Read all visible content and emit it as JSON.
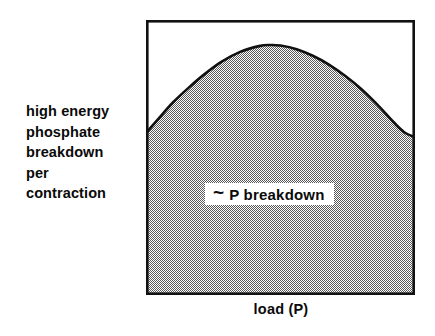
{
  "figure": {
    "name": "high-energy-phosphate-breakdown-vs-load",
    "y_axis_label_lines": [
      "high energy",
      "phosphate",
      "breakdown",
      "per",
      "contraction"
    ],
    "x_axis_label": "load  (P)",
    "annotation": {
      "symbol": "~",
      "text": "P breakdown"
    },
    "colors": {
      "frame": "#111111",
      "curve": "#111111",
      "fill_dither_dark": "#4a4a4a",
      "fill_background": "#ffffff",
      "text": "#0a0a0a",
      "page_background": "#ffffff"
    }
  },
  "chart_data": {
    "type": "area",
    "title": "",
    "xlabel": "load  (P)",
    "ylabel": "high energy phosphate breakdown per contraction",
    "xlim": [
      0,
      1
    ],
    "ylim": [
      0,
      1
    ],
    "grid": false,
    "legend": "none",
    "axis_ticks": {
      "x": [],
      "y": []
    },
    "annotations": [
      {
        "text": "~ P breakdown",
        "x": 0.44,
        "y": 0.4,
        "style": "white-box-label"
      }
    ],
    "series": [
      {
        "name": "~ P breakdown",
        "kind": "filled-area-under-curve",
        "note": "Inverted-U (dome) curve; non-zero at both ends of the load axis, peak at intermediate load.",
        "x": [
          0.0,
          0.05,
          0.1,
          0.16,
          0.22,
          0.28,
          0.35,
          0.42,
          0.46,
          0.5,
          0.56,
          0.62,
          0.68,
          0.74,
          0.8,
          0.86,
          0.92,
          0.96,
          1.0
        ],
        "y": [
          0.589,
          0.645,
          0.7,
          0.755,
          0.805,
          0.848,
          0.884,
          0.905,
          0.909,
          0.907,
          0.894,
          0.87,
          0.838,
          0.797,
          0.749,
          0.692,
          0.629,
          0.592,
          0.574
        ]
      }
    ]
  }
}
